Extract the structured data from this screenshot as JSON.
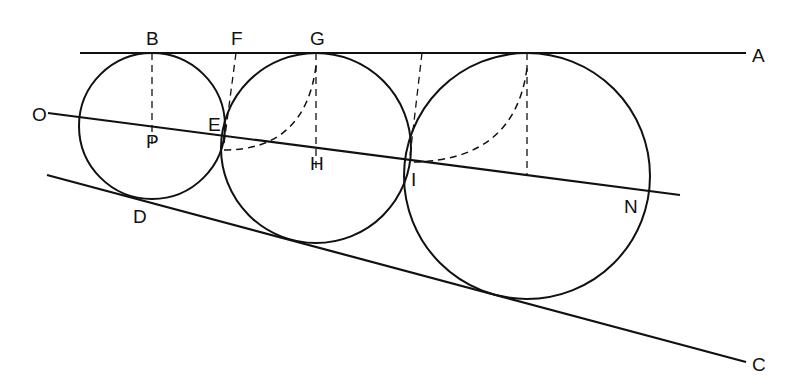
{
  "diagram": {
    "type": "geometry",
    "stroke_color": "#111111",
    "background": "#ffffff",
    "lines": [
      {
        "id": "A",
        "x1": 80,
        "y1": 53,
        "x2": 746,
        "y2": 53
      },
      {
        "id": "O",
        "x1": 48,
        "y1": 113,
        "x2": 680,
        "y2": 195
      },
      {
        "id": "C",
        "x1": 47,
        "y1": 175,
        "x2": 746,
        "y2": 362
      }
    ],
    "circles": [
      {
        "id": "circle-1",
        "cx": 152,
        "cy": 126,
        "r": 73
      },
      {
        "id": "circle-2",
        "cx": 316,
        "cy": 148,
        "r": 95
      },
      {
        "id": "circle-3",
        "cx": 527,
        "cy": 176,
        "r": 123
      }
    ],
    "dashed_segments": [
      {
        "id": "B-P",
        "x1": 152,
        "y1": 53,
        "x2": 152,
        "y2": 147
      },
      {
        "id": "F-E",
        "x1": 236,
        "y1": 53,
        "x2": 224,
        "y2": 144
      },
      {
        "id": "G-H",
        "x1": 316,
        "y1": 53,
        "x2": 316,
        "y2": 168
      },
      {
        "id": "upper-I",
        "x1": 422,
        "y1": 53,
        "x2": 410,
        "y2": 156
      },
      {
        "id": "top3-N",
        "x1": 527,
        "y1": 53,
        "x2": 527,
        "y2": 174
      }
    ],
    "dashed_arcs": [
      {
        "id": "E-G-arc",
        "d": "M 224 150 Q 305 150 316 66"
      },
      {
        "id": "I-top3-arc",
        "d": "M 414 162 Q 515 160 527 68"
      }
    ],
    "labels": [
      {
        "text": "A",
        "x": 752,
        "y": 62
      },
      {
        "text": "B",
        "x": 146,
        "y": 45
      },
      {
        "text": "F",
        "x": 231,
        "y": 45
      },
      {
        "text": "G",
        "x": 310,
        "y": 45
      },
      {
        "text": "O",
        "x": 32,
        "y": 121
      },
      {
        "text": "E",
        "x": 208,
        "y": 131
      },
      {
        "text": "P",
        "x": 146,
        "y": 148
      },
      {
        "text": "H",
        "x": 310,
        "y": 170
      },
      {
        "text": "I",
        "x": 411,
        "y": 186
      },
      {
        "text": "N",
        "x": 624,
        "y": 213
      },
      {
        "text": "D",
        "x": 133,
        "y": 223
      },
      {
        "text": "C",
        "x": 752,
        "y": 371
      }
    ]
  }
}
